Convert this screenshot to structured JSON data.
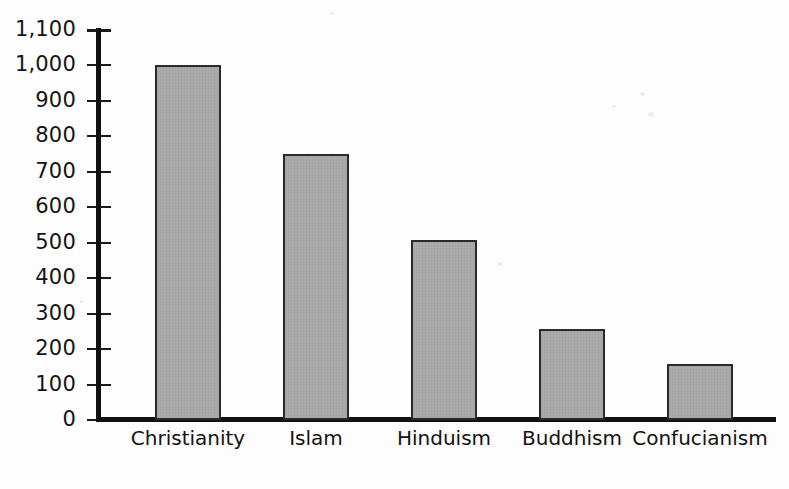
{
  "chart_data": {
    "type": "bar",
    "title": "",
    "xlabel": "",
    "ylabel": "",
    "categories": [
      "Christianity",
      "Islam",
      "Hinduism",
      "Buddhism",
      "Confucianism"
    ],
    "values": [
      1000,
      750,
      508,
      257,
      158
    ],
    "ylim": [
      0,
      1100
    ],
    "ytick_step": 100,
    "ytick_labels": [
      "1,100",
      "1,000",
      "900",
      "800",
      "700",
      "600",
      "500",
      "400",
      "300",
      "200",
      "100",
      "0"
    ],
    "ytick_values": [
      1100,
      1000,
      900,
      800,
      700,
      600,
      500,
      400,
      300,
      200,
      100,
      0
    ],
    "grid": false,
    "legend": false,
    "legend_position": "none",
    "bar_fill_color": "#a9a9a9",
    "bar_border_color": "#2a2a2a",
    "axis_color": "#111111",
    "background_color": "#fdfdfd"
  }
}
